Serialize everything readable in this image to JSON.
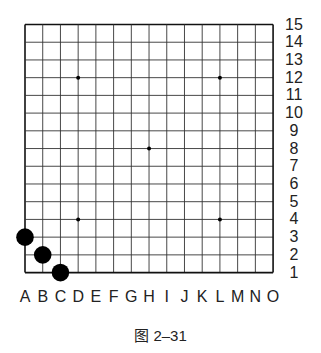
{
  "board": {
    "size": 15,
    "columns": [
      "A",
      "B",
      "C",
      "D",
      "E",
      "F",
      "G",
      "H",
      "I",
      "J",
      "K",
      "L",
      "M",
      "N",
      "O"
    ],
    "rows": [
      "15",
      "14",
      "13",
      "12",
      "11",
      "10",
      "9",
      "8",
      "7",
      "6",
      "5",
      "4",
      "3",
      "2",
      "1"
    ],
    "star_points": [
      "D12",
      "L12",
      "H8",
      "D4",
      "L4"
    ],
    "stones": [
      {
        "pos": "A3",
        "color": "black"
      },
      {
        "pos": "B2",
        "color": "black"
      },
      {
        "pos": "C1",
        "color": "black"
      }
    ],
    "line_color": "#333333",
    "stone_color": "#000000"
  },
  "caption": "图 2–31"
}
